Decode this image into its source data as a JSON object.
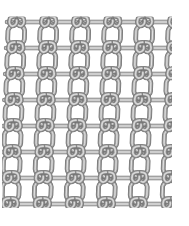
{
  "image": {
    "kind": "wire-mesh-texture",
    "subject": "crimped chain-link wire mesh swatch",
    "width": 189,
    "height": 226,
    "background_color": "#ffffff",
    "alt_text": "Grey crimped chain-link wire mesh panel on a white background"
  },
  "mesh": {
    "origin_x": 13,
    "origin_y": 22,
    "extent_x": 172,
    "extent_y": 208,
    "cell_width": 32,
    "cell_height": 26,
    "columns": 5,
    "rows": 8,
    "wire_thickness": 3.0,
    "skew_degrees": 2,
    "colors": {
      "wire_outline": "#6f6f6f",
      "wire_dark": "#8d8d8d",
      "wire_mid": "#b2b2b2",
      "wire_light": "#d8d8d8",
      "wire_highlight": "#eaeaea",
      "shadow": "#7a7a7a"
    }
  }
}
